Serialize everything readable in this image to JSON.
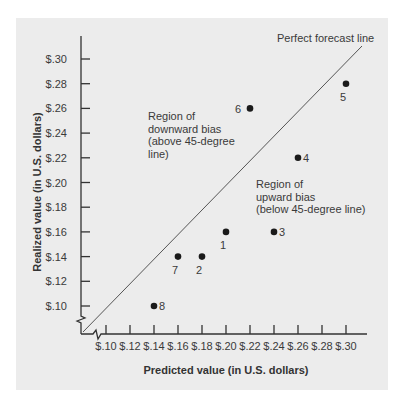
{
  "chart_data": {
    "type": "scatter",
    "title": "",
    "xlabel": "Predicted value (in U.S. dollars)",
    "ylabel": "Realized value (in U.S. dollars)",
    "xlim": [
      0.08,
      0.31
    ],
    "ylim": [
      0.08,
      0.31
    ],
    "x_ticks": [
      "$.10",
      "$.12",
      "$.14",
      "$.16",
      "$.18",
      "$.20",
      "$.22",
      "$.24",
      "$.26",
      "$.28",
      "$.30"
    ],
    "x_tick_values": [
      0.1,
      0.12,
      0.14,
      0.16,
      0.18,
      0.2,
      0.22,
      0.24,
      0.26,
      0.28,
      0.3
    ],
    "y_ticks": [
      "$.10",
      "$.12",
      "$.14",
      "$.16",
      "$.18",
      "$.20",
      "$.22",
      "$.24",
      "$.26",
      "$.28",
      "$.30"
    ],
    "y_tick_values": [
      0.1,
      0.12,
      0.14,
      0.16,
      0.18,
      0.2,
      0.22,
      0.24,
      0.26,
      0.28,
      0.3
    ],
    "grid": false,
    "axis_breaks": true,
    "points": [
      {
        "label": "1",
        "x": 0.2,
        "y": 0.16,
        "label_pos": "below"
      },
      {
        "label": "2",
        "x": 0.18,
        "y": 0.14,
        "label_pos": "below"
      },
      {
        "label": "3",
        "x": 0.24,
        "y": 0.16,
        "label_pos": "right"
      },
      {
        "label": "4",
        "x": 0.26,
        "y": 0.22,
        "label_pos": "right"
      },
      {
        "label": "5",
        "x": 0.3,
        "y": 0.28,
        "label_pos": "below"
      },
      {
        "label": "6",
        "x": 0.22,
        "y": 0.26,
        "label_pos": "left"
      },
      {
        "label": "7",
        "x": 0.16,
        "y": 0.14,
        "label_pos": "below"
      },
      {
        "label": "8",
        "x": 0.14,
        "y": 0.1,
        "label_pos": "right"
      }
    ],
    "reference_line": {
      "label": "Perfect forecast line",
      "type": "45-degree",
      "slope": 1
    },
    "annotations": [
      {
        "name": "downward-bias",
        "lines": [
          "Region of",
          "downward bias",
          "(above 45-degree",
          "line)"
        ]
      },
      {
        "name": "upward-bias",
        "lines": [
          "Region of",
          "upward bias",
          "(below 45-degree line)"
        ]
      }
    ]
  },
  "colors": {
    "panel_bg": "#ececec",
    "axis": "#333333",
    "point": "#1a1a1a",
    "line": "#555555"
  }
}
